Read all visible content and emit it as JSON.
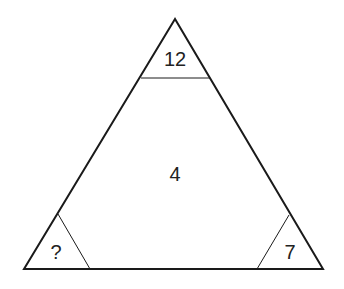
{
  "puzzle": {
    "top_value": "12",
    "center_value": "4",
    "bottom_left_value": "?",
    "bottom_right_value": "7"
  },
  "colors": {
    "stroke": "#1a1a1a",
    "text": "#222222",
    "background": "#ffffff"
  }
}
